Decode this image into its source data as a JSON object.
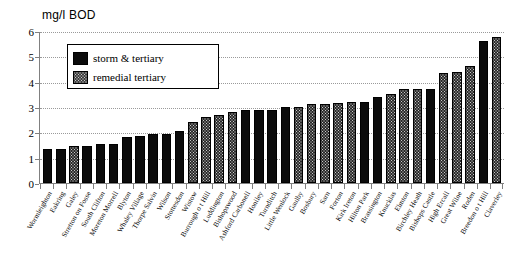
{
  "chart_data": {
    "type": "bar",
    "title": "mg/l BOD",
    "xlabel": "",
    "ylabel": "mg/l BOD",
    "ylim": [
      0,
      6
    ],
    "yticks": [
      0,
      1,
      2,
      3,
      4,
      5,
      6
    ],
    "grid": true,
    "legend_position": "upper-left-inside",
    "legend": [
      {
        "key": "storm",
        "label": "storm & tertiary"
      },
      {
        "key": "remedial",
        "label": "remedial tertiary"
      }
    ],
    "categories": [
      "Wormleighton",
      "Eakring",
      "Galey",
      "Stretton on Fosse",
      "South Clifton",
      "Moreton Morrell",
      "Blyton",
      "Whaley Village",
      "Thorpe Salvin",
      "Wilson",
      "Stottesdon",
      "Wistow",
      "Burrough o t Hill",
      "Luddington",
      "Bishopswood",
      "Ashford Carbonell",
      "Honiley",
      "Turnditch",
      "Little Wenlock",
      "Gaulby",
      "Bosbury",
      "Sarn",
      "Forton",
      "Kirk Ireton",
      "Hilton Park",
      "Brassington",
      "Knucklas",
      "Elmton",
      "Birchley Heath",
      "Bishops Castle",
      "High Ercall",
      "Great Wilne",
      "Roden",
      "Breedon o t Hill",
      "Claverley"
    ],
    "values": [
      1.35,
      1.35,
      1.45,
      1.45,
      1.55,
      1.55,
      1.8,
      1.85,
      1.95,
      1.95,
      2.05,
      2.4,
      2.6,
      2.7,
      2.8,
      2.9,
      2.9,
      2.9,
      3.0,
      3.0,
      3.1,
      3.1,
      3.15,
      3.2,
      3.2,
      3.4,
      3.5,
      3.7,
      3.7,
      3.7,
      4.35,
      4.4,
      4.6,
      5.6,
      5.75
    ],
    "series_key": [
      "storm",
      "storm",
      "remedial",
      "storm",
      "storm",
      "storm",
      "storm",
      "storm",
      "storm",
      "storm",
      "storm",
      "remedial",
      "remedial",
      "remedial",
      "remedial",
      "storm",
      "storm",
      "storm",
      "storm",
      "remedial",
      "remedial",
      "remedial",
      "remedial",
      "remedial",
      "storm",
      "storm",
      "remedial",
      "remedial",
      "remedial",
      "storm",
      "remedial",
      "remedial",
      "remedial",
      "storm",
      "remedial"
    ]
  },
  "colors": {
    "storm": "#0b0b0b",
    "remedial": "#c9c9c9",
    "axis": "#808080",
    "grid": "#9a9a9a",
    "background": "#ffffff"
  }
}
